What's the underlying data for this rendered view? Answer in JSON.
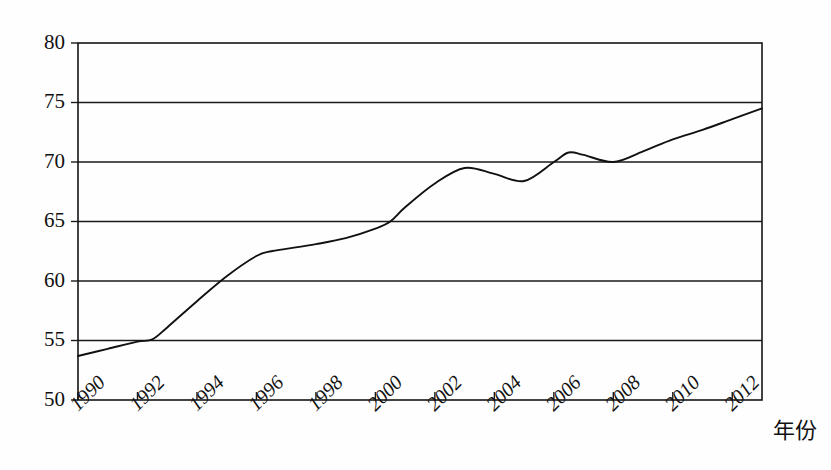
{
  "chart_data": {
    "type": "line",
    "title": "",
    "subtitle": "",
    "xlabel": "年份",
    "ylabel": "",
    "xlim": [
      1990,
      2013
    ],
    "ylim": [
      50,
      80
    ],
    "grid": true,
    "legend": null,
    "x_tick_labels": [
      "1990",
      "1992",
      "1994",
      "1996",
      "1998",
      "2000",
      "2002",
      "2004",
      "2006",
      "2008",
      "2010",
      "2012"
    ],
    "x_ticks": [
      1990,
      1992,
      1994,
      1996,
      1998,
      2000,
      2002,
      2004,
      2006,
      2008,
      2010,
      2012
    ],
    "y_tick_labels": [
      "50",
      "55",
      "60",
      "65",
      "70",
      "75",
      "80"
    ],
    "y_ticks": [
      50,
      55,
      60,
      65,
      70,
      75,
      80
    ],
    "series": [
      {
        "name": "series-1",
        "color": "#111111",
        "x": [
          1990,
          1991,
          1992,
          1992.5,
          1993,
          1994,
          1995,
          1996,
          1996.5,
          1997,
          1998,
          1999,
          2000,
          2000.5,
          2001,
          2002,
          2003,
          2004,
          2005,
          2006,
          2006.5,
          2007,
          2008,
          2009,
          2010,
          2011,
          2012,
          2013
        ],
        "values": [
          53.7,
          54.3,
          54.9,
          55.1,
          56.1,
          58.3,
          60.4,
          62.1,
          62.5,
          62.7,
          63.1,
          63.6,
          64.4,
          65.0,
          66.2,
          68.2,
          69.5,
          69.0,
          68.4,
          70.0,
          70.8,
          70.6,
          70.0,
          70.9,
          71.9,
          72.7,
          73.6,
          74.5
        ]
      }
    ]
  },
  "axis": {
    "x_title": "年份"
  }
}
